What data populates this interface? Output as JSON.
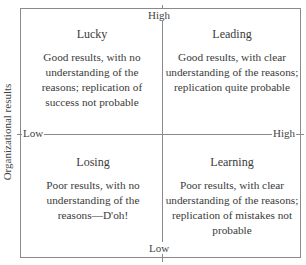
{
  "diagram": {
    "y_axis_label": "Organizational results",
    "axes": {
      "top": "High",
      "bottom": "Low",
      "left": "Low",
      "right": "High"
    },
    "quadrants": [
      {
        "position": "top-left",
        "title": "Lucky",
        "description": "Good results, with no understanding of the reasons; replication of success not probable"
      },
      {
        "position": "top-right",
        "title": "Leading",
        "description": "Good results, with clear understanding of the reasons; replication quite probable"
      },
      {
        "position": "bottom-left",
        "title": "Losing",
        "description": "Poor results, with no understanding of the reasons—D'oh!"
      },
      {
        "position": "bottom-right",
        "title": "Learning",
        "description": "Poor results, with clear understanding of the reasons; replication of mistakes not probable"
      }
    ]
  }
}
